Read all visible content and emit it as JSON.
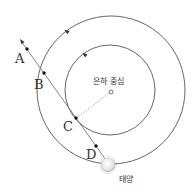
{
  "diagram": {
    "labels": {
      "galactic_center": "은하 중심",
      "sun": "태양",
      "point_a": "A",
      "point_b": "B",
      "point_c": "C",
      "point_d": "D"
    },
    "colors": {
      "line": "#555555",
      "dashed": "#888888",
      "point": "#111111",
      "sun_fill": "#e8e8e8"
    }
  }
}
